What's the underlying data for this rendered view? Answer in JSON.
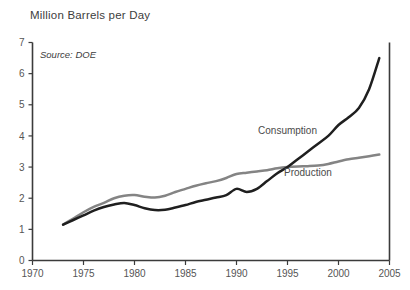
{
  "chart_data": {
    "type": "line",
    "title": "Million Barrels per Day",
    "subtitle": "Source: DOE",
    "xlabel": "",
    "ylabel": "",
    "xlim": [
      1970,
      2005
    ],
    "ylim": [
      0,
      7
    ],
    "grid": false,
    "legend_position": "inline-annotations",
    "xticks": [
      "1970",
      "1975",
      "1980",
      "1985",
      "1990",
      "1995",
      "2000",
      "2005"
    ],
    "xtick_values": [
      1970,
      1975,
      1980,
      1985,
      1990,
      1995,
      2000,
      2005
    ],
    "yticks": [
      "0",
      "1",
      "2",
      "3",
      "4",
      "5",
      "6",
      "7"
    ],
    "ytick_values": [
      0,
      1,
      2,
      3,
      4,
      5,
      6,
      7
    ],
    "series": [
      {
        "name": "Consumption",
        "color": "#1f1f1f",
        "label_x": 1995.0,
        "label_y": 4.05,
        "x": [
          1973,
          1974,
          1975,
          1976,
          1977,
          1978,
          1979,
          1980,
          1981,
          1982,
          1983,
          1984,
          1985,
          1986,
          1987,
          1988,
          1989,
          1990,
          1991,
          1992,
          1993,
          1994,
          1995,
          1996,
          1997,
          1998,
          1999,
          2000,
          2001,
          2002,
          2003,
          2004
        ],
        "y": [
          1.15,
          1.3,
          1.45,
          1.6,
          1.72,
          1.8,
          1.85,
          1.78,
          1.68,
          1.62,
          1.63,
          1.7,
          1.78,
          1.88,
          1.95,
          2.02,
          2.1,
          2.3,
          2.2,
          2.3,
          2.55,
          2.8,
          3.0,
          3.25,
          3.5,
          3.75,
          4.0,
          4.35,
          4.6,
          4.9,
          5.5,
          6.5
        ],
        "endpoint_y": 6.5
      },
      {
        "name": "Production",
        "color": "#848484",
        "label_x": 1997.0,
        "label_y": 2.72,
        "x": [
          1973,
          1974,
          1975,
          1976,
          1977,
          1978,
          1979,
          1980,
          1981,
          1982,
          1983,
          1984,
          1985,
          1986,
          1987,
          1988,
          1989,
          1990,
          1991,
          1992,
          1993,
          1994,
          1995,
          1996,
          1997,
          1998,
          1999,
          2000,
          2001,
          2002,
          2003,
          2004
        ],
        "y": [
          1.15,
          1.35,
          1.55,
          1.72,
          1.85,
          2.0,
          2.08,
          2.1,
          2.05,
          2.02,
          2.08,
          2.2,
          2.3,
          2.4,
          2.48,
          2.55,
          2.65,
          2.78,
          2.82,
          2.86,
          2.9,
          2.96,
          3.0,
          3.02,
          3.03,
          3.05,
          3.1,
          3.18,
          3.25,
          3.3,
          3.35,
          3.4
        ],
        "endpoint_y": 3.4
      }
    ]
  },
  "axes": {
    "left_spine": true,
    "bottom_spine": true,
    "right_spine": true,
    "top_spine": false
  }
}
